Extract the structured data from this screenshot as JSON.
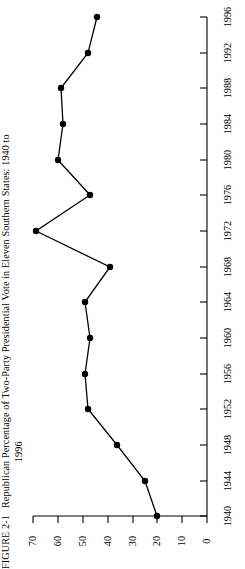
{
  "figure": {
    "label": "FIGURE 2-1",
    "title_line1": "Republican Percentage of Two-Party Presidential Vote in Eleven Southern States: 1940 to",
    "title_line2": "1996"
  },
  "chart_data": {
    "type": "line",
    "title": "Republican Percentage of Two-Party Presidential Vote in Eleven Southern States: 1940 to 1996",
    "orientation": "rotated-90",
    "xlabel": "",
    "ylabel": "",
    "categories": [
      1940,
      1944,
      1948,
      1952,
      1956,
      1960,
      1964,
      1968,
      1972,
      1976,
      1980,
      1984,
      1988,
      1992,
      1996
    ],
    "x": [
      1940,
      1944,
      1948,
      1952,
      1956,
      1960,
      1964,
      1968,
      1972,
      1976,
      1980,
      1984,
      1988,
      1992,
      1996
    ],
    "values": [
      20,
      25,
      36,
      48,
      49,
      47,
      49,
      39,
      69,
      47,
      60,
      58,
      59,
      48,
      44
    ],
    "series": [
      {
        "name": "Republican percentage of two-party presidential vote",
        "values": [
          20,
          25,
          36,
          48,
          49,
          47,
          49,
          39,
          69,
          47,
          60,
          58,
          59,
          48,
          44
        ]
      }
    ],
    "value_axis_ticks": [
      0,
      10,
      20,
      30,
      40,
      50,
      60,
      70
    ],
    "value_axis_tick_labels": [
      "0",
      "10",
      "20",
      "30",
      "40",
      "50",
      "60",
      "70"
    ],
    "ylim": [
      0,
      70
    ],
    "year_axis_ticks": [
      1940,
      1944,
      1948,
      1952,
      1956,
      1960,
      1964,
      1968,
      1972,
      1976,
      1980,
      1984,
      1988,
      1992,
      1996
    ],
    "year_axis_tick_labels": [
      "1940",
      "1944",
      "1948",
      "1952",
      "1956",
      "1960",
      "1964",
      "1968",
      "1972",
      "1976",
      "1980",
      "1984",
      "1988",
      "1992",
      "1996"
    ],
    "xlim": [
      1940,
      1996
    ],
    "grid": false,
    "legend": false,
    "marker": "filled-circle",
    "line_color": "#000000",
    "marker_color": "#000000"
  },
  "axes": {
    "value_ticks": [
      {
        "label": "70",
        "x": 33
      },
      {
        "label": "60",
        "x": 58
      },
      {
        "label": "50",
        "x": 83
      },
      {
        "label": "40",
        "x": 108
      },
      {
        "label": "30",
        "x": 133
      },
      {
        "label": "20",
        "x": 157
      },
      {
        "label": "10",
        "x": 182
      },
      {
        "label": "0",
        "x": 207
      }
    ],
    "year_ticks": [
      {
        "label": "1996",
        "y": 17
      },
      {
        "label": "1992",
        "y": 53
      },
      {
        "label": "1988",
        "y": 88
      },
      {
        "label": "1984",
        "y": 124
      },
      {
        "label": "1980",
        "y": 160
      },
      {
        "label": "1976",
        "y": 195
      },
      {
        "label": "1972",
        "y": 231
      },
      {
        "label": "1968",
        "y": 267
      },
      {
        "label": "1964",
        "y": 302
      },
      {
        "label": "1960",
        "y": 338
      },
      {
        "label": "1956",
        "y": 374
      },
      {
        "label": "1952",
        "y": 409
      },
      {
        "label": "1948",
        "y": 445
      },
      {
        "label": "1944",
        "y": 481
      },
      {
        "label": "1940",
        "y": 516
      }
    ]
  },
  "points": [
    {
      "year": "1996",
      "value": 44,
      "px": 97,
      "py": 17
    },
    {
      "year": "1992",
      "value": 48,
      "px": 88,
      "py": 53
    },
    {
      "year": "1988",
      "value": 59,
      "px": 61,
      "py": 88
    },
    {
      "year": "1984",
      "value": 58,
      "px": 63,
      "py": 124
    },
    {
      "year": "1980",
      "value": 60,
      "px": 58,
      "py": 160
    },
    {
      "year": "1976",
      "value": 47,
      "px": 90,
      "py": 195
    },
    {
      "year": "1972",
      "value": 69,
      "px": 36,
      "py": 231
    },
    {
      "year": "1968",
      "value": 39,
      "px": 110,
      "py": 267
    },
    {
      "year": "1964",
      "value": 49,
      "px": 85,
      "py": 302
    },
    {
      "year": "1960",
      "value": 47,
      "px": 90,
      "py": 338
    },
    {
      "year": "1956",
      "value": 49,
      "px": 85,
      "py": 374
    },
    {
      "year": "1952",
      "value": 48,
      "px": 88,
      "py": 409
    },
    {
      "year": "1948",
      "value": 36,
      "px": 117,
      "py": 445
    },
    {
      "year": "1944",
      "value": 25,
      "px": 145,
      "py": 481
    },
    {
      "year": "1940",
      "value": 20,
      "px": 157,
      "py": 516
    }
  ]
}
